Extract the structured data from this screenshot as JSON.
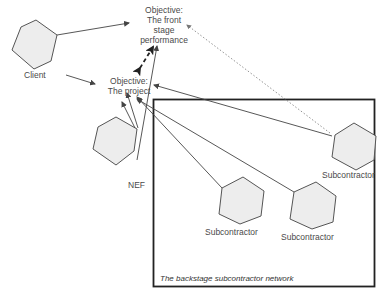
{
  "diagram": {
    "nodes": {
      "client": {
        "label": "Client",
        "shape": "hexagon-icon"
      },
      "nef": {
        "label": "NEF",
        "shape": "hexagon-icon"
      },
      "sub_right": {
        "label": "Subcontractor",
        "shape": "hexagon-icon"
      },
      "sub_mid": {
        "label": "Subcontractor",
        "shape": "hexagon-icon"
      },
      "sub_low": {
        "label": "Subcontractor",
        "shape": "hexagon-icon"
      }
    },
    "objectives": {
      "front_stage": {
        "line1": "Objective:",
        "line2": "The front",
        "line3": "stage",
        "line4": "performance"
      },
      "project": {
        "line1": "Objective:",
        "line2": "The project"
      }
    },
    "network": {
      "label": "The backstage subcontractor network"
    },
    "colors": {
      "hex_fill": "#ededed",
      "hex_stroke": "#555555",
      "line": "#444444",
      "border": "#222222",
      "dotted": "#777777"
    }
  }
}
